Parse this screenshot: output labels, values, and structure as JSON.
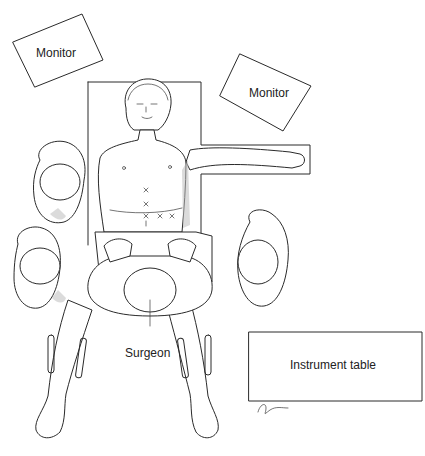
{
  "diagram": {
    "labels": {
      "monitor_left": "Monitor",
      "monitor_right": "Monitor",
      "surgeon": "Surgeon",
      "instrument_table": "Instrument table"
    },
    "port_marks": [
      "x",
      "x",
      "x",
      "x",
      "x"
    ],
    "colors": {
      "line": "#2a2a2a",
      "background": "#ffffff",
      "shading": "#bdbdbd"
    }
  }
}
